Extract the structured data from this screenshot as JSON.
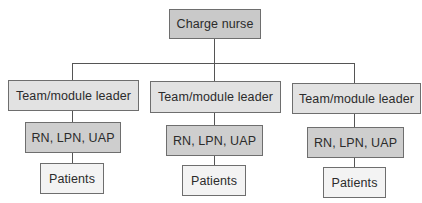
{
  "diagram": {
    "type": "org-chart",
    "title": "",
    "root": {
      "label": "Charge nurse"
    },
    "teams": [
      {
        "leader": "Team/module leader",
        "staff": "RN, LPN, UAP",
        "patients": "Patients"
      },
      {
        "leader": "Team/module leader",
        "staff": "RN, LPN, UAP",
        "patients": "Patients"
      },
      {
        "leader": "Team/module leader",
        "staff": "RN, LPN, UAP",
        "patients": "Patients"
      }
    ],
    "colors": {
      "root_fill": "#c9c9c9",
      "leader_fill": "#e2e2e2",
      "staff_fill": "#cecece",
      "patients_fill": "#f3f3f3",
      "border": "#6e6e6e",
      "connector": "#555555",
      "text": "#2b2b2b"
    }
  }
}
